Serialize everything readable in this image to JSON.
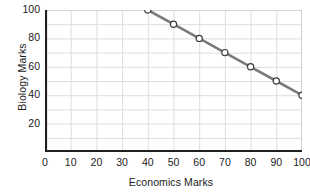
{
  "chart_data": {
    "type": "line",
    "title": "",
    "xlabel": "Economics Marks",
    "ylabel": "Biology Marks",
    "xlim": [
      0,
      100
    ],
    "ylim": [
      0,
      100
    ],
    "xticks": [
      0,
      10,
      20,
      30,
      40,
      50,
      60,
      70,
      80,
      90,
      100
    ],
    "xtick_labels": [
      "0",
      "10",
      "20",
      "30",
      "40",
      "50",
      "60",
      "70",
      "80",
      "90",
      "100"
    ],
    "yticks": [
      20,
      40,
      60,
      80,
      100
    ],
    "ytick_labels": [
      "20",
      "40",
      "60",
      "80",
      "100"
    ],
    "grid": true,
    "grid_spacing_x": 10,
    "grid_spacing_y": 10,
    "legend": null,
    "legend_position": "none",
    "marker": "open-circle",
    "series": [
      {
        "name": "Biology vs Economics",
        "x": [
          40,
          50,
          60,
          70,
          80,
          90,
          100
        ],
        "values": [
          100,
          90,
          80,
          70,
          60,
          50,
          40
        ],
        "points": [
          {
            "x": 40,
            "y": 100
          },
          {
            "x": 50,
            "y": 90
          },
          {
            "x": 60,
            "y": 80
          },
          {
            "x": 70,
            "y": 70
          },
          {
            "x": 80,
            "y": 60
          },
          {
            "x": 90,
            "y": 50
          },
          {
            "x": 100,
            "y": 40
          }
        ]
      }
    ],
    "colors": {
      "line": "#7b7b7b",
      "marker_face": "#ffffff",
      "marker_edge": "#3b3b3b",
      "grid": "#d9dee4",
      "axis": "#231f20",
      "plot_border": "#cfd4da",
      "text": "#1b1b1b",
      "background": "#ffffff"
    }
  }
}
